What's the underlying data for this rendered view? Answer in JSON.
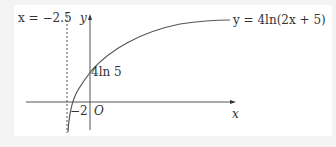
{
  "diagram": {
    "asymptote_label": "x = −2.5",
    "y_axis_label": "y",
    "x_axis_label": "x",
    "curve_label": "y = 4ln(2x + 5)",
    "y_intercept_label": "4ln 5",
    "x_intercept_label": "−2",
    "origin_label": "O"
  },
  "colors": {
    "background": "#f3f3f3",
    "panel": "#ffffff",
    "line": "#555555",
    "text": "#333333"
  }
}
